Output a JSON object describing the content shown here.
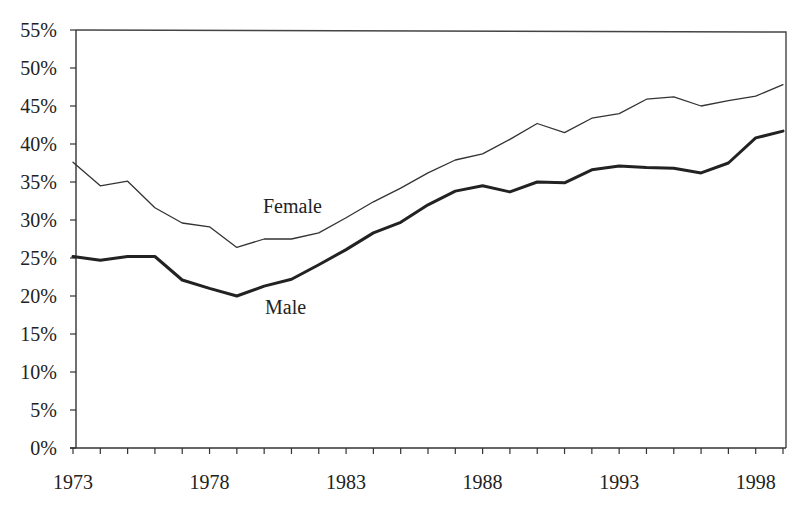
{
  "chart_data": {
    "type": "line",
    "title": "",
    "xlabel": "",
    "ylabel": "",
    "ylim": [
      0,
      55
    ],
    "xlim": [
      1973,
      1999
    ],
    "y_ticks": [
      "0%",
      "5%",
      "10%",
      "15%",
      "20%",
      "25%",
      "30%",
      "35%",
      "40%",
      "45%",
      "50%",
      "55%"
    ],
    "x_tick_labels": [
      "1973",
      "1978",
      "1983",
      "1988",
      "1993",
      "1998"
    ],
    "grid": false,
    "legend": "inline labels",
    "x": [
      1973,
      1974,
      1975,
      1976,
      1977,
      1978,
      1979,
      1980,
      1981,
      1982,
      1983,
      1984,
      1985,
      1986,
      1987,
      1988,
      1989,
      1990,
      1991,
      1992,
      1993,
      1994,
      1995,
      1996,
      1997,
      1998,
      1999
    ],
    "series": [
      {
        "name": "Female",
        "values": [
          37.6,
          34.5,
          35.1,
          31.6,
          29.6,
          29.1,
          26.4,
          27.5,
          27.5,
          28.3,
          30.3,
          32.4,
          34.2,
          36.2,
          37.9,
          38.7,
          40.6,
          42.7,
          41.5,
          43.4,
          44.0,
          45.9,
          46.2,
          45.0,
          45.7,
          46.3,
          47.8
        ],
        "color": "#333333",
        "line_width": 1.3
      },
      {
        "name": "Male",
        "values": [
          25.2,
          24.7,
          25.2,
          25.2,
          22.1,
          21.0,
          20.0,
          21.3,
          22.2,
          24.1,
          26.1,
          28.3,
          29.7,
          32.0,
          33.8,
          34.5,
          33.7,
          35.0,
          34.9,
          36.6,
          37.1,
          36.9,
          36.8,
          36.2,
          37.5,
          40.8,
          41.7
        ],
        "color": "#222222",
        "line_width": 3
      }
    ],
    "annotations": [
      {
        "text": "Female",
        "x": 1980,
        "y": 31.2
      },
      {
        "text": "Male",
        "x": 1980,
        "y": 17.8
      }
    ]
  },
  "labels": {
    "female": "Female",
    "male": "Male"
  }
}
